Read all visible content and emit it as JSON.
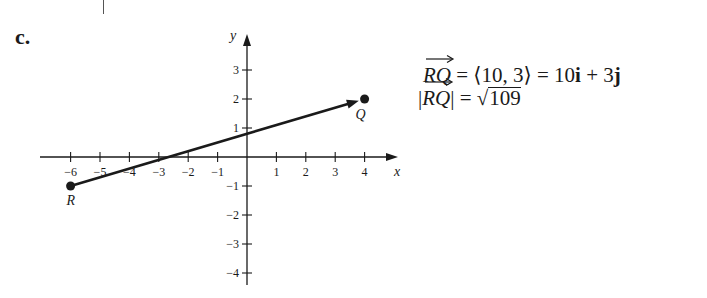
{
  "part_label": "c.",
  "chart_data": {
    "type": "line",
    "title": "",
    "xlabel": "x",
    "ylabel": "y",
    "xlim": [
      -6.5,
      5.5
    ],
    "ylim": [
      -4.3,
      3.8
    ],
    "x_ticks": [
      -6,
      -5,
      -4,
      -3,
      -2,
      -1,
      1,
      2,
      3,
      4
    ],
    "y_ticks": [
      -4,
      -3,
      -2,
      -1,
      1,
      2,
      3
    ],
    "grid": false,
    "series": [
      {
        "name": "vector RQ",
        "x": [
          -6,
          4
        ],
        "y": [
          -1,
          2
        ],
        "arrow": "end"
      }
    ],
    "points": [
      {
        "label": "R",
        "x": -6,
        "y": -1
      },
      {
        "label": "Q",
        "x": 4,
        "y": 2
      }
    ]
  },
  "axis": {
    "x_label": "x",
    "y_label": "y"
  },
  "point_labels": {
    "R": "R",
    "Q": "Q"
  },
  "equations": {
    "line1": {
      "vector": "RQ",
      "eq1": " = ",
      "components": "⟨10, 3⟩",
      "eq2": " = ",
      "ij_10": "10",
      "i": "i",
      "plus": " + ",
      "ij_3": "3",
      "j": "j"
    },
    "line2": {
      "bar_open": "|",
      "vector": "RQ",
      "bar_close": "|",
      "eq": " = ",
      "sqrt_symbol": "√",
      "radicand": "109"
    }
  }
}
